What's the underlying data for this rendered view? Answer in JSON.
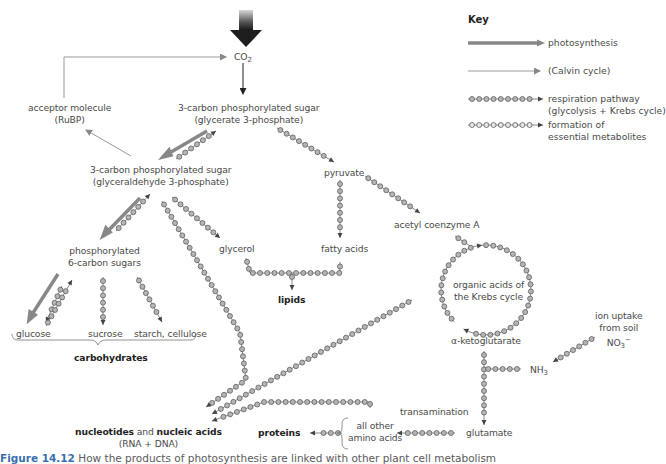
{
  "colors": {
    "photosynthesis_arrow": "#808080",
    "calvin_arrow": "#909090",
    "chain_stroke": "#6a6a6a",
    "chain_fill": "#bdbdbd",
    "text": "#4a4a4a",
    "bold_text": "#1e1e1e",
    "caption_accent": "#3a6fb0"
  },
  "key": {
    "title": "Key",
    "items": [
      {
        "icon": "thick-arrow-icon",
        "label": "photosynthesis"
      },
      {
        "icon": "thin-arrow-icon",
        "label": "(Calvin cycle)"
      },
      {
        "icon": "dark-bead-chain-arrow-icon",
        "label_line1": "respiration pathway",
        "label_line2": "(glycolysis + Krebs cycle)"
      },
      {
        "icon": "light-bead-chain-arrow-icon",
        "label_line1": "formation of",
        "label_line2": "essential metabolites"
      }
    ]
  },
  "nodes": {
    "co2": {
      "base": "CO",
      "sub": "2"
    },
    "acceptor": {
      "line1": "acceptor molecule",
      "line2": "(RuBP)"
    },
    "g3p_acid": {
      "line1": "3-carbon phosphorylated sugar",
      "line2": "(glycerate 3-phosphate)"
    },
    "g3p_ald": {
      "line1": "3-carbon phosphorylated sugar",
      "line2": "(glyceraldehyde 3-phosphate)"
    },
    "pyruvate": "pyruvate",
    "acetyl_coa": "acetyl coenzyme A",
    "hexose": {
      "line1": "phosphorylated",
      "line2": "6-carbon sugars"
    },
    "glycerol": "glycerol",
    "fatty_acids": "fatty acids",
    "lipids": "lipids",
    "glucose": "glucose",
    "sucrose": "sucrose",
    "starch": "starch, cellulose",
    "carbohydrates": "carbohydrates",
    "krebs": {
      "line1": "organic acids of",
      "line2": "the Krebs cycle"
    },
    "ketoglutarate": "α-ketoglutarate",
    "ion_uptake": {
      "line1": "ion uptake",
      "line2": "from soil",
      "no3_base": "NO",
      "no3_sub": "3",
      "no3_sup": "−"
    },
    "nh3": {
      "base": "NH",
      "sub": "3"
    },
    "transamination": "transamination",
    "glutamate": "glutamate",
    "other_amino": {
      "line1": "all other",
      "line2": "amino acids"
    },
    "proteins": "proteins",
    "nucleotides": {
      "part1": "nucleotides",
      "and": " and ",
      "part2": "nucleic acids",
      "line2": "(RNA + DNA)"
    }
  },
  "caption": {
    "figure": "Figure 14.12",
    "text": " How the products of photosynthesis are linked with other plant cell metabolism"
  }
}
